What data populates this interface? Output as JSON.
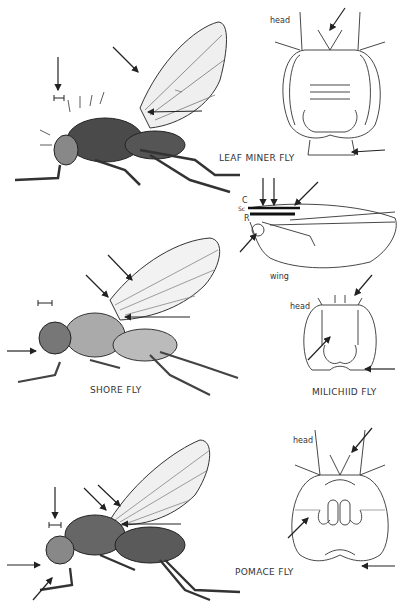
{
  "plate": {
    "figures": [
      {
        "name": "LEAF MINER FLY",
        "side_view": true,
        "detail": "head",
        "detail_label": "head"
      },
      {
        "name": "SHORE FLY",
        "side_view": true,
        "detail": "wing",
        "detail_label": "wing",
        "wing_vein_labels": [
          "C",
          "Sc",
          "R"
        ]
      },
      {
        "name": "MILICHIID FLY",
        "side_view": false,
        "detail": "head",
        "detail_label": "head"
      },
      {
        "name": "POMACE FLY",
        "side_view": true,
        "detail": "head",
        "detail_label": "head"
      }
    ]
  },
  "labels": {
    "leaf_miner": "LEAF MINER FLY",
    "shore": "SHORE FLY",
    "milichiid": "MILICHIID FLY",
    "pomace": "POMACE FLY",
    "head1": "head",
    "head2": "head",
    "head3": "head",
    "wing": "wing",
    "vein_c": "C",
    "vein_sc": "Sc",
    "vein_r": "R"
  },
  "colors": {
    "ink": "#222222",
    "wing_fill": "#eeeeee",
    "body_fill": "#555555",
    "background": "#ffffff"
  }
}
